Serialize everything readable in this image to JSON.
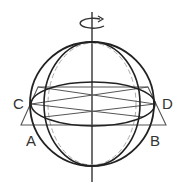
{
  "diagram": {
    "labels": {
      "A": "A",
      "B": "B",
      "C": "C",
      "D": "D"
    },
    "icons": {
      "rotation": "rotation-arrow-icon"
    },
    "colors": {
      "stroke": "#222222",
      "dashed": "#999999",
      "background": "#ffffff"
    }
  }
}
